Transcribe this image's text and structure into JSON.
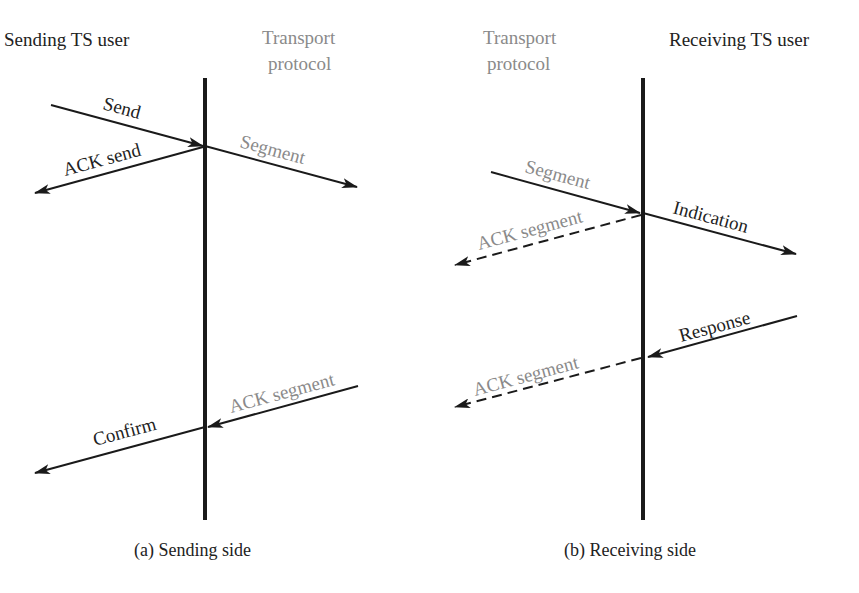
{
  "diagram": {
    "colors": {
      "primary": "#222222",
      "secondary": "#8a8a8a",
      "line": "#1a1a1a"
    },
    "panels": [
      {
        "id": "a",
        "caption": "(a) Sending side",
        "left_header": "Sending TS user",
        "right_header_line1": "Transport",
        "right_header_line2": "protocol",
        "arrows": [
          {
            "label": "Send",
            "style": "solid",
            "from": "Sending TS user",
            "to": "Transport protocol"
          },
          {
            "label": "Segment",
            "style": "solid",
            "from": "Transport protocol",
            "to": "network"
          },
          {
            "label": "ACK send",
            "style": "solid",
            "from": "Transport protocol",
            "to": "Sending TS user"
          },
          {
            "label": "ACK segment",
            "style": "solid",
            "from": "network",
            "to": "Transport protocol"
          },
          {
            "label": "Confirm",
            "style": "solid",
            "from": "Transport protocol",
            "to": "Sending TS user"
          }
        ]
      },
      {
        "id": "b",
        "caption": "(b) Receiving side",
        "left_header_line1": "Transport",
        "left_header_line2": "protocol",
        "right_header": "Receiving TS user",
        "arrows": [
          {
            "label": "Segment",
            "style": "solid",
            "from": "network",
            "to": "Transport protocol"
          },
          {
            "label": "Indication",
            "style": "solid",
            "from": "Transport protocol",
            "to": "Receiving TS user"
          },
          {
            "label": "ACK segment",
            "style": "dashed",
            "from": "Transport protocol",
            "to": "network"
          },
          {
            "label": "Response",
            "style": "solid",
            "from": "Receiving TS user",
            "to": "Transport protocol"
          },
          {
            "label": "ACK segment",
            "style": "dashed",
            "from": "Transport protocol",
            "to": "network"
          }
        ]
      }
    ]
  }
}
